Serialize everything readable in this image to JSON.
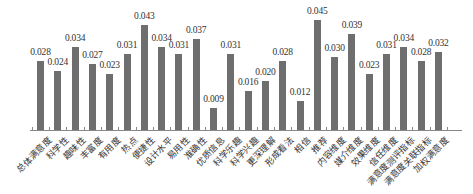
{
  "chart_data": {
    "type": "bar",
    "title": "",
    "xlabel": "",
    "ylabel": "",
    "ylim": [
      0,
      0.046
    ],
    "grid": false,
    "legend": null,
    "bar_color": "#6e6e6e",
    "categories": [
      "总体满意度",
      "科学性",
      "趣味性",
      "丰富度",
      "有用度",
      "热点",
      "便捷性",
      "设计水平",
      "易用性",
      "准确性",
      "优质信息",
      "科学乐趣",
      "科学兴趣",
      "更深理解",
      "形成看法",
      "相信",
      "推荐",
      "内容维度",
      "媒介维度",
      "效果维度",
      "信任维度",
      "满意度测评指标",
      "满意度关联指标",
      "加权满意度"
    ],
    "values": [
      0.028,
      0.024,
      0.034,
      0.027,
      0.023,
      0.031,
      0.043,
      0.034,
      0.031,
      0.037,
      0.009,
      0.031,
      0.016,
      0.02,
      0.028,
      0.012,
      0.045,
      0.03,
      0.039,
      0.023,
      0.031,
      0.034,
      0.028,
      0.032
    ],
    "value_labels": [
      "0.028",
      "0.024",
      "0.034",
      "0.027",
      "0.023",
      "0.031",
      "0.043",
      "0.034",
      "0.031",
      "0.037",
      "0.009",
      "0.031",
      "0.016",
      "0.020",
      "0.028",
      "0.012",
      "0.045",
      "0.030",
      "0.039",
      "0.023",
      "0.031",
      "0.034",
      "0.028",
      "0.032"
    ]
  }
}
